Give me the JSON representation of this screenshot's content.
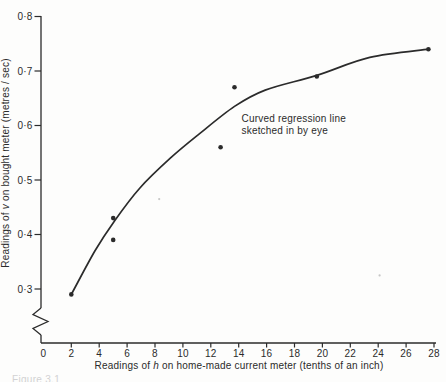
{
  "colors": {
    "ink": "#2b2b2b",
    "paper": "#fdfdfc",
    "faint_caption": "#c4c4c6"
  },
  "chart_data": {
    "type": "scatter",
    "title": "",
    "xlabel_parts": [
      "Readings of ",
      "h",
      " on home-made current meter (tenths of an inch)"
    ],
    "ylabel_parts": [
      "Readings of ",
      "v",
      " on bought meter (metres / sec)"
    ],
    "x_axis": {
      "range": [
        0,
        28
      ],
      "tick_values": [
        0,
        2,
        4,
        6,
        8,
        10,
        12,
        14,
        16,
        18,
        20,
        22,
        24,
        26,
        28
      ],
      "tick_labels": [
        "0",
        "2",
        "4",
        "6",
        "8",
        "10",
        "12",
        "14",
        "16",
        "18",
        "20",
        "22",
        "24",
        "26",
        "28"
      ],
      "grid": false
    },
    "y_axis": {
      "range": [
        0.3,
        0.8
      ],
      "tick_values": [
        0.3,
        0.4,
        0.5,
        0.6,
        0.7,
        0.8
      ],
      "tick_labels": [
        "0·3",
        "0·4",
        "0·5",
        "0·6",
        "0·7",
        "0·8"
      ],
      "axis_break": true,
      "grid": false
    },
    "points": [
      [
        2,
        0.29
      ],
      [
        5,
        0.39
      ],
      [
        5,
        0.43
      ],
      [
        12.7,
        0.56
      ],
      [
        13.7,
        0.67
      ],
      [
        19.6,
        0.69
      ],
      [
        27.6,
        0.74
      ]
    ],
    "curve": {
      "label": "curved-regression-line",
      "points": [
        [
          2,
          0.29
        ],
        [
          3.7,
          0.37
        ],
        [
          5.1,
          0.425
        ],
        [
          6.9,
          0.485
        ],
        [
          9.1,
          0.54
        ],
        [
          11.2,
          0.585
        ],
        [
          13.7,
          0.635
        ],
        [
          15.9,
          0.665
        ],
        [
          19.6,
          0.692
        ],
        [
          23.4,
          0.725
        ],
        [
          27.6,
          0.74
        ]
      ]
    },
    "annotation": {
      "lines": [
        "Curved regression line",
        "sketched in by eye"
      ],
      "anchor": [
        14.2,
        0.615
      ]
    },
    "specks": [
      [
        8.3,
        0.465
      ],
      [
        24.1,
        0.325
      ]
    ],
    "caption_fragment": "Figure 3.1"
  }
}
